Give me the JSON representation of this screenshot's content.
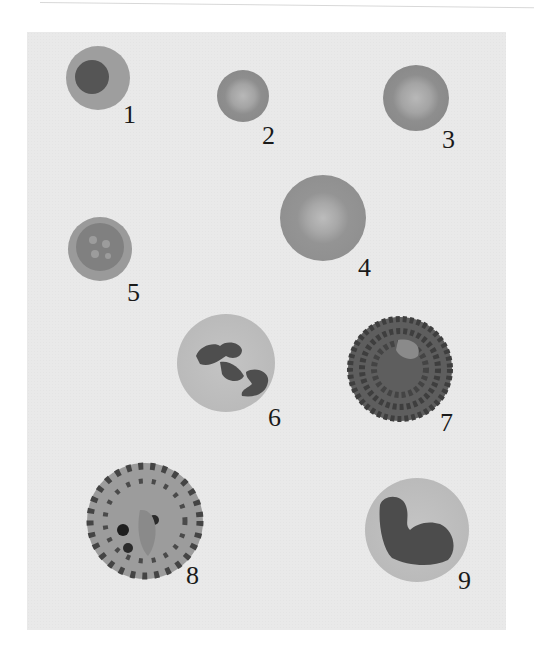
{
  "figure": {
    "background_color": "#e9e9e9",
    "cells": [
      {
        "id": "1",
        "label": "1",
        "type": "nucleated-red-cell",
        "cx": 98,
        "cy": 78,
        "r": 32,
        "label_x": 123,
        "label_y": 102
      },
      {
        "id": "2",
        "label": "2",
        "type": "microcyte",
        "cx": 243,
        "cy": 96,
        "r": 26,
        "label_x": 262,
        "label_y": 123
      },
      {
        "id": "3",
        "label": "3",
        "type": "normocyte",
        "cx": 416,
        "cy": 98,
        "r": 33,
        "label_x": 442,
        "label_y": 127
      },
      {
        "id": "4",
        "label": "4",
        "type": "macrocyte",
        "cx": 323,
        "cy": 218,
        "r": 43,
        "label_x": 358,
        "label_y": 255
      },
      {
        "id": "5",
        "label": "5",
        "type": "stippled-red-cell",
        "cx": 100,
        "cy": 249,
        "r": 32,
        "label_x": 127,
        "label_y": 280
      },
      {
        "id": "6",
        "label": "6",
        "type": "neutrophil",
        "cx": 226,
        "cy": 363,
        "r": 49,
        "label_x": 268,
        "label_y": 405
      },
      {
        "id": "7",
        "label": "7",
        "type": "eosinophil",
        "cx": 400,
        "cy": 369,
        "r": 52,
        "label_x": 440,
        "label_y": 410
      },
      {
        "id": "8",
        "label": "8",
        "type": "basophil",
        "cx": 145,
        "cy": 521,
        "r": 58,
        "label_x": 186,
        "label_y": 563
      },
      {
        "id": "9",
        "label": "9",
        "type": "monocyte",
        "cx": 417,
        "cy": 530,
        "r": 52,
        "label_x": 458,
        "label_y": 568
      }
    ]
  }
}
